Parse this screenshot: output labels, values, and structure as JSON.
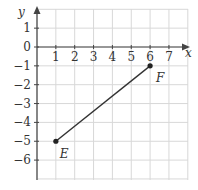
{
  "chart_data": {
    "type": "line",
    "title": "",
    "xlabel": "x",
    "ylabel": "y",
    "xlim": [
      0,
      8
    ],
    "ylim": [
      -7,
      2
    ],
    "grid": true,
    "x_ticks": [
      "1",
      "2",
      "3",
      "4",
      "5",
      "6",
      "7"
    ],
    "y_ticks": [
      "1",
      "0",
      "−1",
      "−2",
      "−3",
      "−4",
      "−5",
      "−6"
    ],
    "points": [
      {
        "label": "E",
        "x": 1,
        "y": -5
      },
      {
        "label": "F",
        "x": 6,
        "y": -1
      }
    ],
    "segments": [
      {
        "from": "E",
        "to": "F"
      }
    ]
  },
  "labels": {
    "x_axis": "x",
    "y_axis": "y",
    "point_e": "E",
    "point_f": "F"
  },
  "colors": {
    "grid": "#d8d8d8",
    "axis": "#444444",
    "line": "#333333"
  }
}
